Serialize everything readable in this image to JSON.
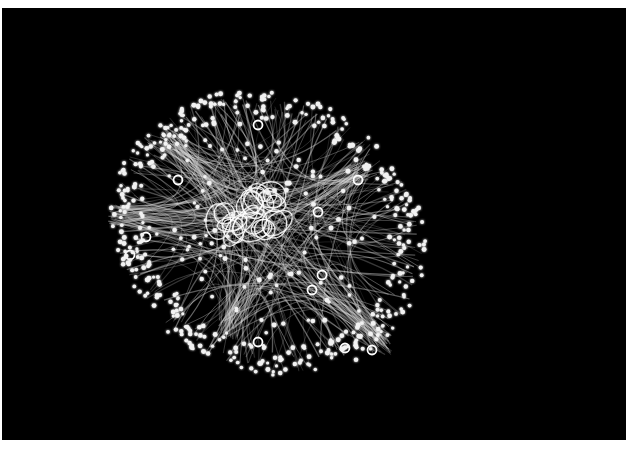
{
  "figure": {
    "description": "Network graph visualization with bundled curved edges and glowing nodes on black background",
    "background": "#000000",
    "page_background": "#ffffff",
    "node_color": "#f2f2f2",
    "edge_color": "#d9d9d9",
    "loop_color": "#ffffff"
  },
  "graph": {
    "center": [
      268,
      233
    ],
    "radius_x": 158,
    "radius_y": 136,
    "rotation_deg": 25,
    "node_count": 520,
    "edge_count": 260,
    "self_loop_cluster": {
      "cx": 248,
      "cy": 212,
      "count": 22
    },
    "ring_loops": [
      [
        146,
        237
      ],
      [
        130,
        255
      ],
      [
        318,
        212
      ],
      [
        322,
        275
      ],
      [
        312,
        290
      ],
      [
        258,
        342
      ],
      [
        345,
        348
      ],
      [
        372,
        350
      ],
      [
        178,
        180
      ],
      [
        258,
        125
      ],
      [
        358,
        180
      ]
    ],
    "hubs": [
      [
        118,
        215
      ],
      [
        228,
        330
      ],
      [
        382,
        345
      ],
      [
        360,
        170
      ],
      [
        170,
        140
      ]
    ]
  }
}
